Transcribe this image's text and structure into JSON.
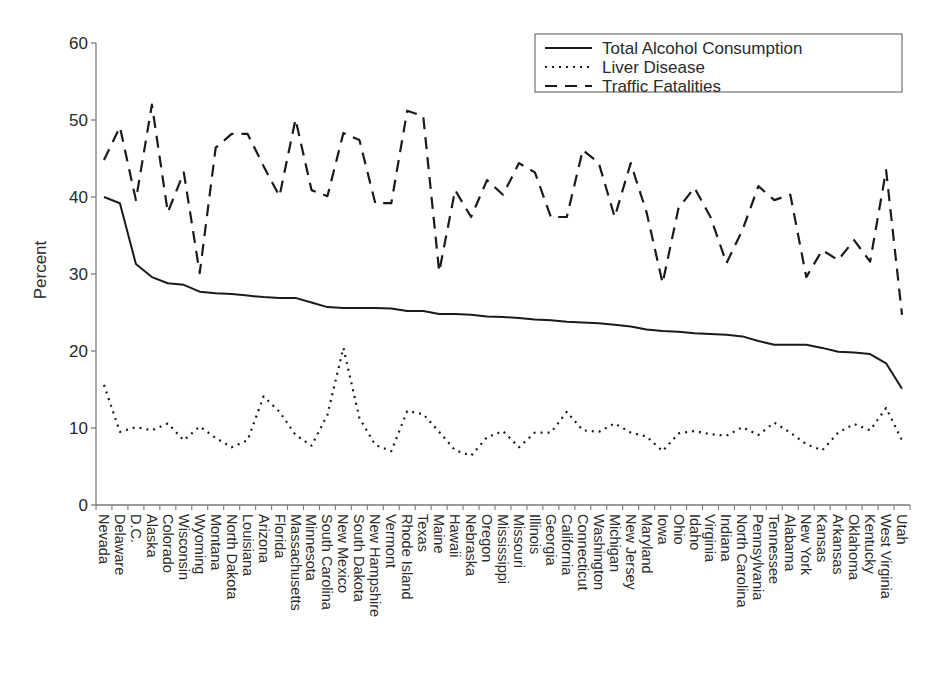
{
  "chart_data": {
    "type": "line",
    "title": "",
    "xlabel": "",
    "ylabel": "Percent",
    "ylim": [
      0,
      60
    ],
    "yticks": [
      0,
      10,
      20,
      30,
      40,
      50,
      60
    ],
    "grid": false,
    "legend_position": "top-right",
    "categories": [
      "Nevada",
      "Delaware",
      "D.C.",
      "Alaska",
      "Colorado",
      "Wisconsin",
      "Wyoming",
      "Montana",
      "North Dakota",
      "Louisiana",
      "Arizona",
      "Florida",
      "Massachusetts",
      "Minnesota",
      "South Carolina",
      "New Mexico",
      "South Dakota",
      "New Hampshire",
      "Vermont",
      "Rhode Island",
      "Texas",
      "Maine",
      "Hawaii",
      "Nebraska",
      "Oregon",
      "Mississippi",
      "Missouri",
      "Illinois",
      "Georgia",
      "California",
      "Connecticut",
      "Washington",
      "Michigan",
      "New Jersey",
      "Maryland",
      "Iowa",
      "Ohio",
      "Idaho",
      "Virginia",
      "Indiana",
      "North Carolina",
      "Pennsylvania",
      "Tennessee",
      "Alabama",
      "New York",
      "Kansas",
      "Arkansas",
      "Oklahoma",
      "Kentucky",
      "West Virginia",
      "Utah"
    ],
    "series": [
      {
        "name": "Total Alcohol Consumption",
        "style": "solid",
        "values": [
          40.0,
          39.2,
          31.3,
          29.6,
          28.8,
          28.6,
          27.7,
          27.5,
          27.4,
          27.2,
          27.0,
          26.9,
          26.9,
          26.3,
          25.7,
          25.6,
          25.6,
          25.6,
          25.5,
          25.2,
          25.2,
          24.8,
          24.8,
          24.7,
          24.5,
          24.4,
          24.3,
          24.1,
          24.0,
          23.8,
          23.7,
          23.6,
          23.4,
          23.2,
          22.8,
          22.6,
          22.5,
          22.3,
          22.2,
          22.1,
          21.9,
          21.3,
          20.8,
          20.8,
          20.8,
          20.4,
          19.9,
          19.8,
          19.6,
          18.4,
          15.1
        ]
      },
      {
        "name": "Liver Disease",
        "style": "dotted",
        "values": [
          15.6,
          9.5,
          10.1,
          9.7,
          10.6,
          8.4,
          10.2,
          8.7,
          7.5,
          8.4,
          14.1,
          12.1,
          9.1,
          7.7,
          11.7,
          20.4,
          11.3,
          7.8,
          7.0,
          12.2,
          11.8,
          9.5,
          7.1,
          6.4,
          8.8,
          9.6,
          7.5,
          9.4,
          9.4,
          12.1,
          9.7,
          9.5,
          10.6,
          9.4,
          8.9,
          7.0,
          9.3,
          9.6,
          9.2,
          9.0,
          10.1,
          9.1,
          10.7,
          9.4,
          7.9,
          7.1,
          9.4,
          10.5,
          9.7,
          12.6,
          8.4
        ]
      },
      {
        "name": "Traffic Fatalities",
        "style": "dashed",
        "values": [
          44.8,
          49.1,
          39.6,
          52.0,
          38.0,
          43.2,
          30.1,
          46.4,
          48.2,
          48.2,
          44.0,
          40.1,
          50.1,
          40.9,
          40.1,
          48.3,
          47.4,
          39.2,
          39.2,
          51.2,
          50.5,
          30.3,
          40.9,
          37.4,
          42.2,
          40.3,
          44.4,
          43.2,
          37.4,
          37.4,
          46.1,
          44.4,
          37.4,
          44.4,
          38.0,
          28.8,
          38.6,
          41.2,
          37.4,
          31.4,
          35.7,
          41.4,
          39.6,
          40.3,
          29.6,
          33.1,
          31.8,
          34.4,
          31.6,
          43.5,
          24.7
        ]
      }
    ]
  },
  "axis": {
    "y_title": "Percent",
    "y_tick_labels": [
      "0",
      "10",
      "20",
      "30",
      "40",
      "50",
      "60"
    ]
  },
  "legend": {
    "items": [
      {
        "label": "Total Alcohol Consumption",
        "style": "solid"
      },
      {
        "label": "Liver Disease",
        "style": "dotted"
      },
      {
        "label": "Traffic Fatalities",
        "style": "dashed"
      }
    ]
  },
  "colors": {
    "line": "#1a1a1a",
    "axis": "#7a7a7a",
    "text": "#2a2a2a",
    "background": "#ffffff"
  }
}
